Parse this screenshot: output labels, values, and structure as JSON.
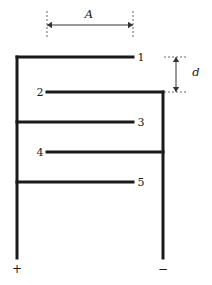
{
  "figure": {
    "type": "schematic-diagram",
    "width": 212,
    "height": 285,
    "background_color": "#ffffff",
    "line_color": "#1a1a1a",
    "dim_line_color": "#555555",
    "plate_thickness_px": 3,
    "rail_thickness_px": 3
  },
  "dimensions": {
    "plate_length": {
      "label": "A",
      "orientation": "horizontal",
      "arrow_style": "double-headed",
      "extension_line_style": "dashed",
      "x_start": 47,
      "x_end": 133,
      "arrow_y": 25,
      "label_x": 89,
      "label_y": 15
    },
    "plate_separation": {
      "label": "d",
      "orientation": "vertical",
      "arrow_style": "double-headed",
      "extension_line_style": "dashed",
      "y_start": 57,
      "y_end": 92,
      "arrow_x": 176,
      "label_x": 196,
      "label_y": 73
    }
  },
  "rails": {
    "positive": {
      "terminal_label": "+",
      "x": 17,
      "y_top": 57,
      "y_bottom": 258,
      "terminal_x": 17,
      "terminal_y": 269,
      "connects_plates": [
        1,
        3,
        5
      ]
    },
    "negative": {
      "terminal_label": "−",
      "x": 163,
      "y_top": 92,
      "y_bottom": 258,
      "terminal_x": 163,
      "terminal_y": 269,
      "connects_plates": [
        2,
        4
      ]
    }
  },
  "plates": [
    {
      "label": "1",
      "y": 57,
      "x_start": 17,
      "x_end": 133,
      "attached_rail": "positive",
      "label_x": 141,
      "label_y": 57
    },
    {
      "label": "2",
      "y": 92,
      "x_start": 47,
      "x_end": 163,
      "attached_rail": "negative",
      "label_x": 40,
      "label_y": 92
    },
    {
      "label": "3",
      "y": 122,
      "x_start": 17,
      "x_end": 133,
      "attached_rail": "positive",
      "label_x": 141,
      "label_y": 122
    },
    {
      "label": "4",
      "y": 152,
      "x_start": 47,
      "x_end": 163,
      "attached_rail": "negative",
      "label_x": 40,
      "label_y": 152
    },
    {
      "label": "5",
      "y": 182,
      "x_start": 17,
      "x_end": 133,
      "attached_rail": "positive",
      "label_x": 141,
      "label_y": 182
    }
  ]
}
